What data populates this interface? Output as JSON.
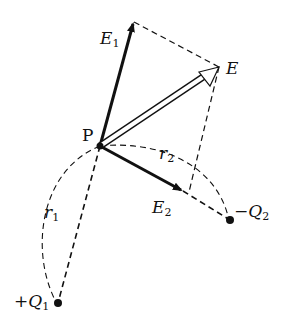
{
  "diagram": {
    "type": "vector superposition of electric field",
    "labels": {
      "P": "P",
      "E": "E",
      "E1_main": "E",
      "E1_sub": "1",
      "E2_main": "E",
      "E2_sub": "2",
      "r1_main": "r",
      "r1_sub": "1",
      "r2_main": "r",
      "r2_sub": "2",
      "Q1_main": "+Q",
      "Q1_sub": "1",
      "Q2_main": "−Q",
      "Q2_sub": "2"
    },
    "points": {
      "P": [
        100,
        146
      ],
      "E1_tip": [
        134,
        22
      ],
      "E_tip": [
        219,
        67
      ],
      "E2_tip": [
        183,
        191
      ],
      "Q1": [
        58,
        303
      ],
      "Q2": [
        230,
        220
      ]
    },
    "colors": {
      "stroke": "#111111",
      "background": "#ffffff"
    }
  }
}
